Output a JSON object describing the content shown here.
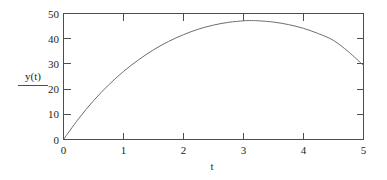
{
  "chart_data": {
    "type": "line",
    "title": "",
    "subtitle": "",
    "xlabel": "t",
    "ylabel": "y(t)",
    "xlim": [
      0,
      5
    ],
    "ylim": [
      0,
      50
    ],
    "grid": false,
    "legend_position": "left-outside",
    "x_ticks": [
      "0",
      "1",
      "2",
      "3",
      "4",
      "5"
    ],
    "x_tick_values": [
      0,
      1,
      2,
      3,
      4,
      5
    ],
    "y_ticks": [
      "0",
      "10",
      "20",
      "30",
      "40",
      "50"
    ],
    "y_tick_values": [
      0,
      10,
      20,
      30,
      40,
      50
    ],
    "series": [
      {
        "name": "y(t)",
        "color": "#6e6e6e",
        "x": [
          0,
          0.25,
          0.5,
          0.75,
          1,
          1.25,
          1.5,
          1.75,
          2,
          2.25,
          2.5,
          2.75,
          3,
          3.1,
          3.25,
          3.5,
          3.75,
          4,
          4.25,
          4.5,
          4.75,
          5
        ],
        "values": [
          0,
          8.2,
          15.4,
          21.6,
          27.0,
          31.6,
          35.6,
          38.9,
          41.6,
          43.8,
          45.4,
          46.5,
          47.1,
          47.2,
          47.1,
          46.6,
          45.6,
          44.1,
          42.0,
          39.3,
          34.8,
          29.4
        ]
      }
    ],
    "annotations": []
  },
  "axes": {
    "x_axis_name": "t-axis",
    "y_axis_name": "y-axis"
  }
}
